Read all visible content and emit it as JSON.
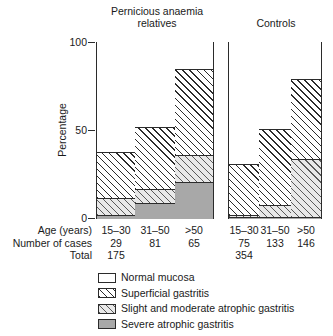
{
  "chart_data": {
    "type": "bar",
    "subtype": "stacked-percentage",
    "title": "",
    "xlabel": "Age (years)",
    "ylabel": "Percentage",
    "ylim": [
      0,
      100
    ],
    "yticks": [
      0,
      50,
      100
    ],
    "grid": false,
    "legend_position": "bottom",
    "groups": [
      "Pernicious anaemia relatives",
      "Controls"
    ],
    "categories": [
      "15–30",
      "31–50",
      ">50",
      "15–30",
      "31–50",
      ">50"
    ],
    "series": [
      {
        "name": "Normal mucosa",
        "values": [
          62,
          48,
          15,
          69,
          49,
          21
        ]
      },
      {
        "name": "Superficial gastritis",
        "values": [
          26,
          35,
          49,
          29,
          43,
          45
        ]
      },
      {
        "name": "Slight and moderate atrophic gastritis",
        "values": [
          10,
          8,
          15,
          1,
          7,
          33
        ]
      },
      {
        "name": "Severe atrophic gastritis",
        "values": [
          2,
          9,
          21,
          1,
          1,
          1
        ]
      }
    ],
    "number_of_cases": [
      29,
      81,
      65,
      75,
      133,
      146
    ],
    "totals": [
      175,
      354
    ]
  },
  "titles": {
    "pernicious": "Pernicious anaemia\nrelatives",
    "pernicious_line1": "Pernicious anaemia",
    "pernicious_line2": "relatives",
    "controls": "Controls"
  },
  "axis": {
    "ylabel": "Percentage",
    "tick_100": "100",
    "tick_50": "50",
    "tick_0": "0"
  },
  "table": {
    "row_labels": {
      "age": "Age (years)",
      "cases": "Number of cases",
      "total": "Total"
    },
    "age": [
      "15–30",
      "31–50",
      ">50",
      "15–30",
      "31–50",
      ">50"
    ],
    "cases": [
      "29",
      "81",
      "65",
      "75",
      "133",
      "146"
    ],
    "totals": [
      "175",
      "354"
    ]
  },
  "legend": {
    "items": [
      {
        "label": "Normal mucosa",
        "pattern": "solid-white",
        "color": "#ffffff"
      },
      {
        "label": "Superficial gastritis",
        "pattern": "diagonal-hatch-dense",
        "color": "#2b2b2b"
      },
      {
        "label": "Slight and moderate atrophic gastritis",
        "pattern": "diagonal-hatch-light",
        "color": "#5a5a5a"
      },
      {
        "label": "Severe atrophic gastritis",
        "pattern": "solid-grey",
        "color": "#a8a8a8"
      }
    ]
  }
}
